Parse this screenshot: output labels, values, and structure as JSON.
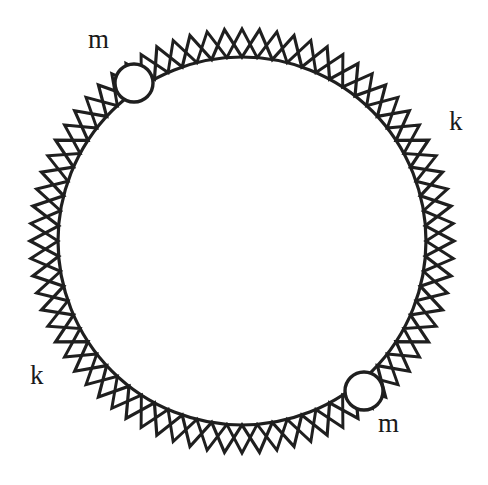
{
  "figure": {
    "type": "physics-schematic",
    "canvas": {
      "width": 488,
      "height": 485,
      "background": "#ffffff"
    },
    "ring": {
      "center": {
        "x": 242,
        "y": 241
      },
      "inner_radius": 184,
      "outer_radius": 212,
      "stroke_color": "#1f1f1f",
      "stroke_width": 3.2,
      "zigzag_teeth": 38,
      "description": "closed circular chain of zigzag spring segments with triangular teeth pointing radially outward"
    },
    "masses": [
      {
        "id": "mass-upper-left",
        "label": "m",
        "center": {
          "x": 134,
          "y": 83
        },
        "radius": 19,
        "angle_deg": 221,
        "fill": "none",
        "stroke_color": "#1f1f1f",
        "stroke_width": 3.4
      },
      {
        "id": "mass-lower-right",
        "label": "m",
        "center": {
          "x": 364,
          "y": 391
        },
        "radius": 19,
        "angle_deg": 39,
        "fill": "none",
        "stroke_color": "#1f1f1f",
        "stroke_width": 3.4
      }
    ],
    "labels": [
      {
        "id": "label-m-top-left",
        "text": "m",
        "x": 88,
        "y": 26,
        "name": "mass-label-upper-left"
      },
      {
        "id": "label-k-right",
        "text": "k",
        "x": 449,
        "y": 108,
        "name": "spring-label-right"
      },
      {
        "id": "label-k-left",
        "text": "k",
        "x": 30,
        "y": 362,
        "name": "spring-label-lower-left"
      },
      {
        "id": "label-m-bottom-right",
        "text": "m",
        "x": 378,
        "y": 410,
        "name": "mass-label-lower-right"
      }
    ],
    "legend": {
      "m": "point mass",
      "k": "spring constant"
    },
    "colors": {
      "ink": "#1f1f1f",
      "paper": "#ffffff"
    }
  }
}
